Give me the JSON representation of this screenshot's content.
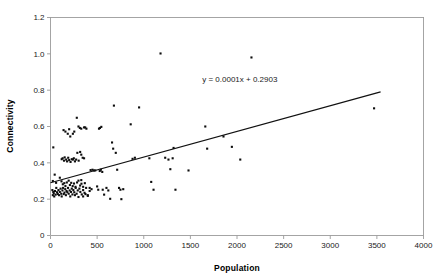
{
  "chart_data": {
    "type": "scatter",
    "title": "",
    "xlabel": "Population",
    "ylabel": "Connectivity",
    "xlim": [
      0,
      4000
    ],
    "ylim": [
      0,
      1.2
    ],
    "grid": false,
    "legend": "none",
    "xticks": [
      "0",
      "500",
      "1000",
      "1500",
      "2000",
      "2500",
      "3000",
      "3500",
      "4000"
    ],
    "xtick_values": [
      0,
      500,
      1000,
      1500,
      2000,
      2500,
      3000,
      3500,
      4000
    ],
    "yticks": [
      "0",
      "0.2",
      "0.4",
      "0.6",
      "0.8",
      "1.0",
      "1.2"
    ],
    "ytick_values": [
      0,
      0.2,
      0.4,
      0.6,
      0.8,
      1.0,
      1.2
    ],
    "annotations": [
      {
        "text": "y = 0.0001x + 0.2903",
        "x": 2030,
        "y": 0.845
      }
    ],
    "trendline": {
      "equation": "y = 0.0001x + 0.2903",
      "slope": 0.0001,
      "intercept": 0.2903,
      "x_start": 0,
      "y_start": 0.2903,
      "x_end": 3540,
      "y_end": 0.7903
    },
    "series": [
      {
        "name": "Settlements",
        "marker": "square",
        "color": "#0d0d0d",
        "points": [
          [
            30,
            0.485
          ],
          [
            45,
            0.335
          ],
          [
            25,
            0.3
          ],
          [
            60,
            0.29
          ],
          [
            20,
            0.25
          ],
          [
            30,
            0.24
          ],
          [
            35,
            0.232
          ],
          [
            25,
            0.222
          ],
          [
            40,
            0.215
          ],
          [
            55,
            0.225
          ],
          [
            48,
            0.245
          ],
          [
            62,
            0.262
          ],
          [
            70,
            0.238
          ],
          [
            78,
            0.228
          ],
          [
            85,
            0.25
          ],
          [
            92,
            0.222
          ],
          [
            100,
            0.24
          ],
          [
            108,
            0.258
          ],
          [
            115,
            0.23
          ],
          [
            120,
            0.215
          ],
          [
            128,
            0.248
          ],
          [
            135,
            0.262
          ],
          [
            142,
            0.228
          ],
          [
            150,
            0.236
          ],
          [
            158,
            0.255
          ],
          [
            165,
            0.222
          ],
          [
            172,
            0.245
          ],
          [
            180,
            0.238
          ],
          [
            188,
            0.262
          ],
          [
            195,
            0.23
          ],
          [
            205,
            0.248
          ],
          [
            212,
            0.215
          ],
          [
            220,
            0.24
          ],
          [
            228,
            0.258
          ],
          [
            235,
            0.226
          ],
          [
            245,
            0.25
          ],
          [
            255,
            0.238
          ],
          [
            262,
            0.222
          ],
          [
            270,
            0.262
          ],
          [
            280,
            0.23
          ],
          [
            292,
            0.248
          ],
          [
            300,
            0.212
          ],
          [
            310,
            0.258
          ],
          [
            320,
            0.24
          ],
          [
            335,
            0.226
          ],
          [
            350,
            0.25
          ],
          [
            365,
            0.235
          ],
          [
            382,
            0.262
          ],
          [
            400,
            0.222
          ],
          [
            420,
            0.245
          ],
          [
            140,
            0.58
          ],
          [
            160,
            0.572
          ],
          [
            185,
            0.56
          ],
          [
            200,
            0.585
          ],
          [
            212,
            0.545
          ],
          [
            240,
            0.56
          ],
          [
            255,
            0.572
          ],
          [
            282,
            0.648
          ],
          [
            300,
            0.6
          ],
          [
            315,
            0.592
          ],
          [
            330,
            0.588
          ],
          [
            360,
            0.595
          ],
          [
            372,
            0.595
          ],
          [
            385,
            0.588
          ],
          [
            120,
            0.42
          ],
          [
            130,
            0.425
          ],
          [
            145,
            0.412
          ],
          [
            152,
            0.43
          ],
          [
            168,
            0.418
          ],
          [
            178,
            0.408
          ],
          [
            190,
            0.428
          ],
          [
            200,
            0.415
          ],
          [
            215,
            0.405
          ],
          [
            228,
            0.42
          ],
          [
            240,
            0.418
          ],
          [
            250,
            0.425
          ],
          [
            262,
            0.408
          ],
          [
            275,
            0.418
          ],
          [
            288,
            0.455
          ],
          [
            302,
            0.412
          ],
          [
            318,
            0.46
          ],
          [
            330,
            0.445
          ],
          [
            345,
            0.428
          ],
          [
            360,
            0.425
          ],
          [
            100,
            0.318
          ],
          [
            118,
            0.298
          ],
          [
            132,
            0.282
          ],
          [
            148,
            0.288
          ],
          [
            160,
            0.272
          ],
          [
            175,
            0.292
          ],
          [
            195,
            0.302
          ],
          [
            208,
            0.278
          ],
          [
            222,
            0.29
          ],
          [
            238,
            0.272
          ],
          [
            252,
            0.286
          ],
          [
            268,
            0.268
          ],
          [
            285,
            0.292
          ],
          [
            300,
            0.302
          ],
          [
            318,
            0.275
          ],
          [
            332,
            0.285
          ],
          [
            350,
            0.268
          ],
          [
            368,
            0.288
          ],
          [
            330,
            0.305
          ],
          [
            350,
            0.215
          ],
          [
            375,
            0.228
          ],
          [
            400,
            0.218
          ],
          [
            420,
            0.262
          ],
          [
            440,
            0.255
          ],
          [
            430,
            0.36
          ],
          [
            450,
            0.362
          ],
          [
            465,
            0.358
          ],
          [
            480,
            0.358
          ],
          [
            500,
            0.27
          ],
          [
            512,
            0.252
          ],
          [
            528,
            0.355
          ],
          [
            540,
            0.362
          ],
          [
            555,
            0.35
          ],
          [
            520,
            0.588
          ],
          [
            530,
            0.592
          ],
          [
            545,
            0.598
          ],
          [
            560,
            0.252
          ],
          [
            575,
            0.225
          ],
          [
            600,
            0.262
          ],
          [
            620,
            0.248
          ],
          [
            640,
            0.202
          ],
          [
            660,
            0.512
          ],
          [
            672,
            0.478
          ],
          [
            680,
            0.715
          ],
          [
            700,
            0.455
          ],
          [
            715,
            0.362
          ],
          [
            735,
            0.262
          ],
          [
            750,
            0.252
          ],
          [
            760,
            0.2
          ],
          [
            780,
            0.255
          ],
          [
            860,
            0.612
          ],
          [
            880,
            0.422
          ],
          [
            905,
            0.428
          ],
          [
            950,
            0.705
          ],
          [
            1060,
            0.425
          ],
          [
            1080,
            0.295
          ],
          [
            1105,
            0.252
          ],
          [
            1180,
            1.002
          ],
          [
            1230,
            0.428
          ],
          [
            1265,
            0.418
          ],
          [
            1285,
            0.365
          ],
          [
            1310,
            0.425
          ],
          [
            1320,
            0.482
          ],
          [
            1340,
            0.252
          ],
          [
            1480,
            0.358
          ],
          [
            1660,
            0.6
          ],
          [
            1680,
            0.478
          ],
          [
            1855,
            0.545
          ],
          [
            1945,
            0.488
          ],
          [
            2035,
            0.418
          ],
          [
            2155,
            0.98
          ],
          [
            3470,
            0.7
          ]
        ]
      }
    ]
  },
  "axes": {
    "x_title": "Population",
    "y_title": "Connectivity"
  }
}
